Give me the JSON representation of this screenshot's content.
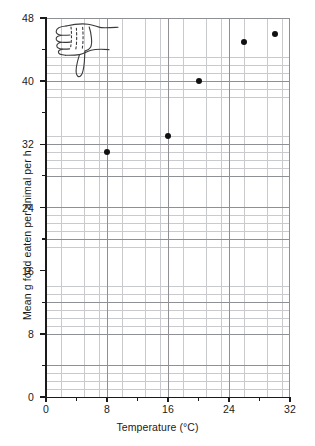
{
  "chart_data": {
    "type": "scatter",
    "title": "",
    "xlabel": "Temperature (°C)",
    "ylabel": "Mean g food eaten per animal per h",
    "xlim": [
      0,
      32
    ],
    "ylim": [
      0,
      48
    ],
    "xticks": [
      0,
      8,
      16,
      24,
      32
    ],
    "yticks": [
      0,
      8,
      16,
      24,
      32,
      40,
      48
    ],
    "xtick_labels": [
      "0",
      "8",
      "16",
      "24",
      "32"
    ],
    "ytick_labels": [
      "0",
      "8",
      "16",
      "24",
      "32",
      "40",
      "48"
    ],
    "grid": true,
    "grid_minor_step_x": 1,
    "grid_minor_step_y": 1,
    "grid_major_step_x": 4,
    "grid_major_step_y": 4,
    "legend": "none",
    "series": [
      {
        "name": "Mean g food eaten per animal per h",
        "marker": "filled-circle",
        "color": "#111111",
        "points": [
          {
            "x": 8,
            "y": 31
          },
          {
            "x": 16,
            "y": 33
          },
          {
            "x": 20,
            "y": 40
          },
          {
            "x": 26,
            "y": 45
          },
          {
            "x": 30,
            "y": 46
          }
        ]
      }
    ],
    "annotations": [
      {
        "name": "thumbs-down-doodle",
        "type": "hand-drawn-sketch",
        "description": "thumbs down hand drawing",
        "x_range": [
          0.3,
          9.5
        ],
        "y_range": [
          39.5,
          47.5
        ]
      }
    ]
  },
  "axes": {
    "x_title": "Temperature (°C)",
    "y_title": "Mean g food eaten per animal per h"
  },
  "colors": {
    "marker": "#111111",
    "axis": "#1a1a1a",
    "grid_major": "#8f9095",
    "grid_minor": "#c9cace",
    "background": "#ffffff"
  }
}
